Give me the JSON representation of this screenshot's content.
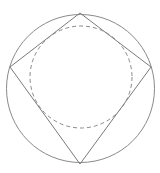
{
  "diagram": {
    "elements": [
      {
        "id": "outer-circle",
        "kind": "circle",
        "style": "solid"
      },
      {
        "id": "inscribed-quadrilateral",
        "kind": "polygon",
        "vertices": 4,
        "style": "solid"
      },
      {
        "id": "incircle",
        "kind": "circle",
        "style": "dashed"
      }
    ],
    "colors": {
      "stroke": "#8a8a8a",
      "background": "#ffffff"
    }
  }
}
